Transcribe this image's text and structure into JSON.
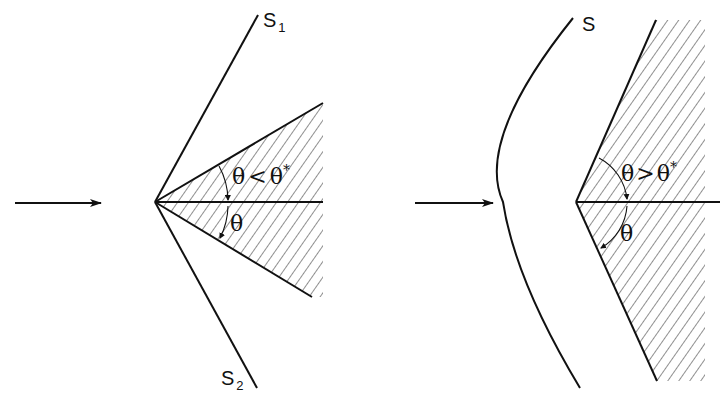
{
  "figure": {
    "left_panel": {
      "description": "Attached oblique shocks on a wedge",
      "shock_labels": [
        "S",
        "S"
      ],
      "shock_subscripts": [
        "1",
        "2"
      ],
      "condition_label_theta": "θ",
      "condition_label_relation": "<",
      "condition_label_critical": "θ",
      "condition_label_star": "*",
      "half_angle_label": "θ",
      "flow_direction": "left-to-right arrow"
    },
    "right_panel": {
      "description": "Detached curved bow shock ahead of a wedge",
      "shock_label": "S",
      "condition_label_theta": "θ",
      "condition_label_relation": ">",
      "condition_label_critical": "θ",
      "condition_label_star": "*",
      "half_angle_label": "θ",
      "flow_direction": "left-to-right arrow"
    },
    "colors": {
      "line": "#111111",
      "background": "#ffffff"
    }
  }
}
